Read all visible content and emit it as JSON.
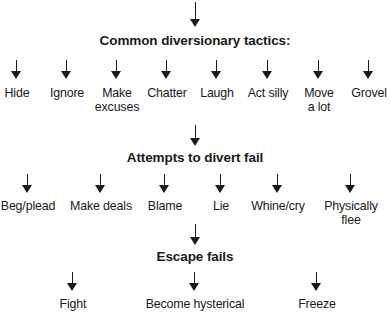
{
  "diagram": {
    "background_color": "#ffffff",
    "ink_color": "#1a1a1a",
    "entry_arrow": "down-arrow",
    "stages": [
      {
        "heading": "Common diversionary tactics:",
        "branches": [
          {
            "label": "Hide"
          },
          {
            "label": "Ignore"
          },
          {
            "label": "Make\nexcuses"
          },
          {
            "label": "Chatter"
          },
          {
            "label": "Laugh"
          },
          {
            "label": "Act silly"
          },
          {
            "label": "Move\na lot"
          },
          {
            "label": "Grovel"
          }
        ]
      },
      {
        "heading": "Attempts to divert fail",
        "branches": [
          {
            "label": "Beg/plead"
          },
          {
            "label": "Make deals"
          },
          {
            "label": "Blame"
          },
          {
            "label": "Lie"
          },
          {
            "label": "Whine/cry"
          },
          {
            "label": "Physically flee"
          }
        ]
      },
      {
        "heading": "Escape fails",
        "branches": [
          {
            "label": "Fight"
          },
          {
            "label": "Become hysterical"
          },
          {
            "label": "Freeze"
          }
        ]
      }
    ]
  }
}
